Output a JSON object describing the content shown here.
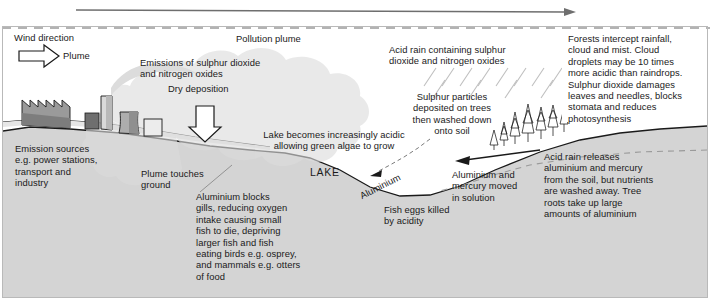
{
  "diagram": {
    "title_flow_arrow": "prevailing-wind-flow",
    "colors": {
      "ground": "#d4d4d4",
      "sky": "#ffffff",
      "plume": "#dcdcdc",
      "outline": "#1a1a1a",
      "frame": "#b9b9b9",
      "arrow_top": "#6e6e6e",
      "dashed": "#9a9a9a"
    },
    "labels": {
      "wind_direction": "Wind direction",
      "plume": "Plume",
      "pollution_plume": "Pollution plume",
      "emissions": "Emissions of sulphur dioxide\nand nitrogen oxides",
      "dry_deposition": "Dry deposition",
      "acid_rain_containing": "Acid rain containing sulphur\ndioxide and nitrogen oxides",
      "forests_intercept": "Forests intercept rainfall,\ncloud and mist. Cloud\ndroplets may be 10 times\nmore acidic than raindrops.\nSulphur dioxide damages\nleaves and needles, blocks\nstomata and reduces\nphotosynthesis",
      "sulphur_particles": "Sulphur particles\ndeposited on trees\nthen washed down\nonto soil",
      "lake_becomes": "Lake becomes increasingly acidic\nallowing green algae to grow",
      "emission_sources": "Emission sources\ne.g. power stations,\ntransport and\nindustry",
      "plume_touches_ground": "Plume touches\nground",
      "aluminium_blocks": "Aluminium blocks\ngills, reducing oxygen\nintake causing small\nfish to die, depriving\nlarger fish and fish\neating birds e.g. osprey,\nand mammals e.g. otters\nof food",
      "lake": "LAKE",
      "aluminium_flow": "Aluminium",
      "fish_eggs": "Fish eggs killed\nby acidity",
      "aluminium_mercury_moved": "Aluminium and\nmercury moved\nin solution",
      "acid_rain_releases": "Acid rain releases\naluminium and mercury\nfrom the soil, but nutrients\nare washed away. Tree\nroots take up large\namounts of aluminium"
    },
    "icons": {
      "wind_arrow": "block-arrow-right-icon",
      "dry_deposition_arrow": "block-arrow-down-icon",
      "top_flow_arrow": "long-arrow-right-icon",
      "soil_flow_arrow": "arrow-left-icon",
      "aluminium_arrow": "arrow-left-small-icon",
      "factory": "factory-icon",
      "chimney": "chimney-icon",
      "cooling_tower": "cooling-tower-icon",
      "conifer_trees": "conifer-trees-icon",
      "rain_streaks": "rain-streaks-icon"
    }
  }
}
